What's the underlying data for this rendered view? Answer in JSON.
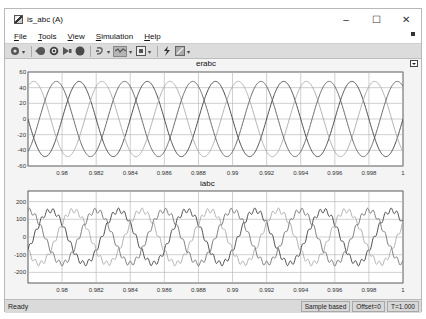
{
  "window": {
    "title": "is_abc (A)",
    "controls": {
      "minimize": "–",
      "maximize": "☐",
      "close": "✕"
    }
  },
  "menu": {
    "items": [
      "File",
      "Tools",
      "View",
      "Simulation",
      "Help"
    ]
  },
  "toolbar": {
    "buttons": [
      {
        "name": "configuration-properties",
        "icon": "gear-icon",
        "dropdown": true
      },
      {
        "name": "step-back",
        "icon": "step-back-icon"
      },
      {
        "name": "run",
        "icon": "run-icon"
      },
      {
        "name": "step-forward",
        "icon": "step-forward-icon"
      },
      {
        "name": "stop",
        "icon": "stop-icon"
      },
      {
        "name": "highlight-simulink-block",
        "icon": "highlight-icon",
        "dropdown": true
      },
      {
        "name": "zoom",
        "icon": "zoom-icon",
        "dropdown": true,
        "active": true
      },
      {
        "name": "autoscale",
        "icon": "autoscale-icon",
        "dropdown": true
      },
      {
        "name": "triggers",
        "icon": "trigger-icon"
      },
      {
        "name": "cursor-measurements",
        "icon": "measure-icon",
        "dropdown": true
      }
    ]
  },
  "colors": {
    "window_bg": "#f0f0f0",
    "plot_bg": "#ffffff",
    "grid": "#b0b0b0",
    "trace_dark": "#3a3a3a",
    "trace_mid": "#6e6e6e",
    "trace_light": "#a8a8a8"
  },
  "status": {
    "ready": "Ready",
    "sample_mode": "Sample based",
    "offset": "Offset=0",
    "time": "T=1.000"
  },
  "chart_data": [
    {
      "type": "line",
      "title": "erabc",
      "xlabel": "",
      "ylabel": "",
      "xlim": [
        0.978,
        1.0
      ],
      "ylim": [
        -60,
        60
      ],
      "x_ticks": [
        "0.98",
        "0.982",
        "0.984",
        "0.986",
        "0.988",
        "0.99",
        "0.992",
        "0.994",
        "0.996",
        "0.998",
        "1"
      ],
      "y_ticks": [
        "60",
        "40",
        "20",
        "0",
        "-20",
        "-40",
        "-60"
      ],
      "grid": true,
      "legend": "none",
      "series": [
        {
          "name": "phase a",
          "amplitude": 48,
          "frequency_hz": 250,
          "phase_deg": 0,
          "color": "#3a3a3a"
        },
        {
          "name": "phase b",
          "amplitude": 48,
          "frequency_hz": 250,
          "phase_deg": -120,
          "color": "#a8a8a8"
        },
        {
          "name": "phase c",
          "amplitude": 48,
          "frequency_hz": 250,
          "phase_deg": 120,
          "color": "#5a5a5a"
        }
      ]
    },
    {
      "type": "line",
      "title": "iabc",
      "xlabel": "",
      "ylabel": "",
      "xlim": [
        0.978,
        1.0
      ],
      "ylim": [
        -260,
        260
      ],
      "x_ticks": [
        "0.98",
        "0.982",
        "0.984",
        "0.986",
        "0.988",
        "0.99",
        "0.992",
        "0.994",
        "0.996",
        "0.998",
        "1"
      ],
      "y_ticks": [
        "200",
        "100",
        "0",
        "-100",
        "-200"
      ],
      "grid": true,
      "legend": "none",
      "series": [
        {
          "name": "phase a",
          "amplitude": 150,
          "ripple": 14,
          "frequency_hz": 250,
          "phase_deg": 150,
          "color": "#3a3a3a"
        },
        {
          "name": "phase b",
          "amplitude": 150,
          "ripple": 14,
          "frequency_hz": 250,
          "phase_deg": 30,
          "color": "#a8a8a8"
        },
        {
          "name": "phase c",
          "amplitude": 150,
          "ripple": 14,
          "frequency_hz": 250,
          "phase_deg": -90,
          "color": "#6e6e6e"
        }
      ]
    }
  ]
}
